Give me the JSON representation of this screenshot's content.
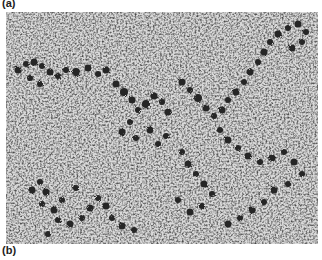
{
  "figure": {
    "panel_labels": {
      "a": "(a)",
      "b": "(b)"
    },
    "image": {
      "subject": "electron micrograph of beaded fibers (nucleosome-like particles on strands)",
      "background_color": "#b8b8b8",
      "particle_color": "#2a2a2a",
      "texture_light": "#e6e6e6",
      "texture_dark": "#6a6a6a"
    }
  }
}
